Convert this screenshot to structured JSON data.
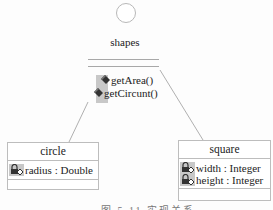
{
  "diagram": {
    "type": "uml-class-realization",
    "interface": {
      "name": "shapes",
      "symbol": "lollipop-circle",
      "operations": [
        {
          "icon": "public-operation-icon",
          "label": "getArea()"
        },
        {
          "icon": "public-operation-icon",
          "label": "getCircunt()"
        }
      ]
    },
    "classes": [
      {
        "name": "circle",
        "attributes": [
          {
            "icon": "private-attribute-icon",
            "label": "radius : Double"
          }
        ]
      },
      {
        "name": "square",
        "attributes": [
          {
            "icon": "private-attribute-icon",
            "label": "width : Integer"
          },
          {
            "icon": "private-attribute-icon",
            "label": "height : Integer"
          }
        ]
      }
    ],
    "relations": [
      {
        "from": "circle",
        "to": "shapes",
        "kind": "realization"
      },
      {
        "from": "square",
        "to": "shapes",
        "kind": "realization"
      }
    ],
    "caption": "图 5.11 实现关系"
  },
  "colors": {
    "line": "#b0b0b0",
    "icon_bg": "#c8c8c8",
    "text": "#222222"
  }
}
